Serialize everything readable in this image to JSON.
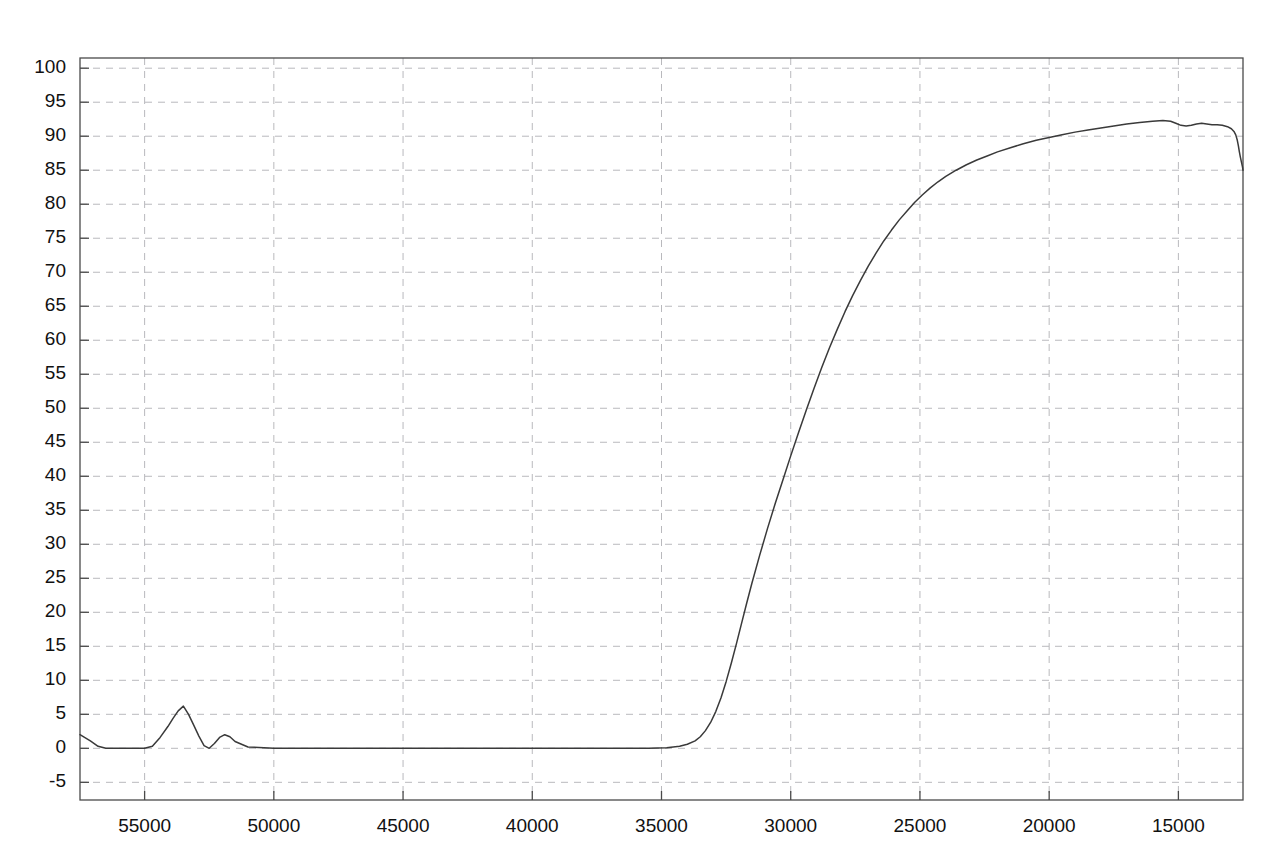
{
  "chart_data": {
    "type": "line",
    "title": "",
    "subtitle": "",
    "xlabel": "",
    "ylabel": "",
    "xlim": [
      57500,
      12500
    ],
    "ylim": [
      -7.6,
      101.5
    ],
    "x_axis_reversed": true,
    "grid": true,
    "legend": null,
    "legend_position": "none",
    "xticks": [
      55000,
      50000,
      45000,
      40000,
      35000,
      30000,
      25000,
      20000,
      15000
    ],
    "xtick_labels": [
      "55000",
      "50000",
      "45000",
      "40000",
      "35000",
      "30000",
      "25000",
      "20000",
      "15000"
    ],
    "yticks": [
      -5,
      0,
      5,
      10,
      15,
      20,
      25,
      30,
      35,
      40,
      45,
      50,
      55,
      60,
      65,
      70,
      75,
      80,
      85,
      90,
      95,
      100
    ],
    "ytick_labels": [
      "-5",
      "0",
      "5",
      "10",
      "15",
      "20",
      "25",
      "30",
      "35",
      "40",
      "45",
      "50",
      "55",
      "60",
      "65",
      "70",
      "75",
      "80",
      "85",
      "90",
      "95",
      "100"
    ],
    "series": [
      {
        "name": "transmittance",
        "color": "#3a3a3a",
        "x": [
          57500,
          57100,
          56800,
          56500,
          56200,
          55900,
          55600,
          55300,
          55000,
          54700,
          54400,
          54100,
          53900,
          53700,
          53500,
          53300,
          53100,
          52900,
          52700,
          52500,
          52300,
          52100,
          51900,
          51700,
          51500,
          51000,
          50000,
          48000,
          46000,
          44000,
          42000,
          40000,
          38000,
          36500,
          35500,
          34800,
          34300,
          34000,
          33700,
          33500,
          33300,
          33100,
          32900,
          32700,
          32500,
          32300,
          32100,
          31900,
          31700,
          31500,
          31200,
          30900,
          30600,
          30300,
          30000,
          29700,
          29400,
          29100,
          28800,
          28500,
          28200,
          27900,
          27600,
          27300,
          27000,
          26700,
          26400,
          26100,
          25800,
          25500,
          25200,
          24900,
          24600,
          24300,
          24000,
          23600,
          23200,
          22800,
          22400,
          22000,
          21500,
          21000,
          20500,
          20000,
          19500,
          19000,
          18500,
          18000,
          17500,
          17000,
          16500,
          16000,
          15600,
          15300,
          15100,
          14900,
          14700,
          14500,
          14300,
          14100,
          13900,
          13700,
          13500,
          13300,
          13100,
          12950,
          12850,
          12780,
          12720,
          12680,
          12640,
          12600,
          12560,
          12520,
          12500
        ],
        "y": [
          2.0,
          1.1,
          0.3,
          0.0,
          0.0,
          0.0,
          0.0,
          0.0,
          0.0,
          0.3,
          1.6,
          3.2,
          4.4,
          5.5,
          6.2,
          5.0,
          3.4,
          1.8,
          0.4,
          0.0,
          0.7,
          1.6,
          2.0,
          1.7,
          1.0,
          0.2,
          0.0,
          0.0,
          0.0,
          0.0,
          0.0,
          0.0,
          0.0,
          0.0,
          0.0,
          0.1,
          0.3,
          0.6,
          1.1,
          1.7,
          2.6,
          3.8,
          5.4,
          7.4,
          9.8,
          12.5,
          15.4,
          18.4,
          21.4,
          24.3,
          28.4,
          32.3,
          36.0,
          39.5,
          43.0,
          46.4,
          49.7,
          52.9,
          56.0,
          58.9,
          61.6,
          64.2,
          66.6,
          68.8,
          70.9,
          72.8,
          74.6,
          76.2,
          77.7,
          79.0,
          80.3,
          81.4,
          82.4,
          83.3,
          84.1,
          85.0,
          85.8,
          86.5,
          87.1,
          87.7,
          88.3,
          88.9,
          89.4,
          89.8,
          90.2,
          90.6,
          90.9,
          91.2,
          91.5,
          91.8,
          92.0,
          92.2,
          92.3,
          92.2,
          91.9,
          91.6,
          91.5,
          91.6,
          91.8,
          91.9,
          91.8,
          91.7,
          91.7,
          91.6,
          91.4,
          91.1,
          90.7,
          90.2,
          89.4,
          88.6,
          87.7,
          86.9,
          86.2,
          85.5,
          85.0
        ]
      }
    ]
  }
}
